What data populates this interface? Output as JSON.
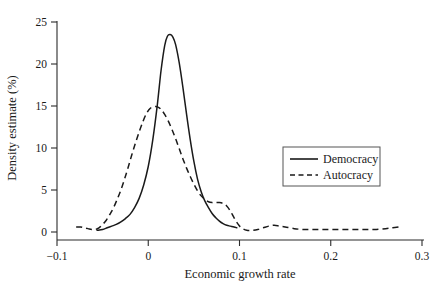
{
  "chart_data": {
    "type": "line",
    "title": "",
    "subtitle": "",
    "xlabel": "Economic growth rate",
    "ylabel": "Density estimate (%)",
    "xlim": [
      -0.1,
      0.3
    ],
    "ylim": [
      0,
      25
    ],
    "xticks": [
      -0.1,
      0,
      0.1,
      0.2,
      0.3
    ],
    "xtick_labels": [
      "−0.1",
      "0",
      "0.1",
      "0.2",
      "0.3"
    ],
    "yticks": [
      0,
      5,
      10,
      15,
      20,
      25
    ],
    "ytick_labels": [
      "0",
      "5",
      "10",
      "15",
      "20",
      "25"
    ],
    "grid": false,
    "legend_position": "center-right",
    "series": [
      {
        "name": "Democracy",
        "style": "solid",
        "color": "#1a1a1a",
        "x": [
          -0.056,
          -0.05,
          -0.045,
          -0.04,
          -0.035,
          -0.03,
          -0.025,
          -0.02,
          -0.015,
          -0.01,
          -0.005,
          0.0,
          0.005,
          0.01,
          0.014,
          0.018,
          0.021,
          0.024,
          0.027,
          0.03,
          0.034,
          0.038,
          0.042,
          0.046,
          0.05,
          0.054,
          0.058,
          0.062,
          0.066,
          0.07,
          0.074,
          0.078,
          0.082,
          0.086,
          0.09,
          0.094,
          0.097
        ],
        "y": [
          0.2,
          0.3,
          0.5,
          0.7,
          0.9,
          1.2,
          1.6,
          2.1,
          2.9,
          4.0,
          5.6,
          7.8,
          11.0,
          15.2,
          19.2,
          22.2,
          23.3,
          23.5,
          23.2,
          22.3,
          20.1,
          17.2,
          14.0,
          11.0,
          8.4,
          6.3,
          4.8,
          3.7,
          2.9,
          2.2,
          1.7,
          1.3,
          1.0,
          0.8,
          0.7,
          0.6,
          0.5
        ]
      },
      {
        "name": "Autocracy",
        "style": "dashed",
        "color": "#1a1a1a",
        "x": [
          -0.079,
          -0.074,
          -0.07,
          -0.066,
          -0.062,
          -0.058,
          -0.054,
          -0.05,
          -0.046,
          -0.042,
          -0.038,
          -0.034,
          -0.03,
          -0.026,
          -0.022,
          -0.018,
          -0.014,
          -0.01,
          -0.006,
          -0.002,
          0.002,
          0.006,
          0.01,
          0.014,
          0.018,
          0.022,
          0.026,
          0.03,
          0.034,
          0.038,
          0.042,
          0.046,
          0.05,
          0.054,
          0.058,
          0.062,
          0.066,
          0.07,
          0.074,
          0.078,
          0.082,
          0.086,
          0.09,
          0.094,
          0.098,
          0.102,
          0.108,
          0.114,
          0.12,
          0.126,
          0.132,
          0.138,
          0.144,
          0.15,
          0.16,
          0.17,
          0.18,
          0.19,
          0.2,
          0.21,
          0.22,
          0.23,
          0.24,
          0.25,
          0.26,
          0.268,
          0.275
        ],
        "y": [
          0.6,
          0.6,
          0.5,
          0.4,
          0.3,
          0.3,
          0.5,
          0.9,
          1.4,
          2.1,
          2.9,
          3.9,
          5.0,
          6.3,
          7.7,
          9.2,
          10.6,
          11.9,
          13.1,
          14.1,
          14.7,
          14.9,
          14.9,
          14.6,
          14.0,
          13.2,
          12.2,
          11.1,
          9.9,
          8.7,
          7.6,
          6.6,
          5.7,
          4.9,
          4.3,
          3.9,
          3.6,
          3.5,
          3.5,
          3.5,
          3.4,
          3.1,
          2.5,
          1.7,
          1.0,
          0.5,
          0.2,
          0.2,
          0.3,
          0.5,
          0.7,
          0.8,
          0.7,
          0.6,
          0.4,
          0.3,
          0.3,
          0.3,
          0.3,
          0.3,
          0.3,
          0.3,
          0.3,
          0.3,
          0.4,
          0.5,
          0.6
        ]
      }
    ],
    "legend": [
      {
        "label": "Democracy",
        "style": "solid"
      },
      {
        "label": "Autocracy",
        "style": "dashed"
      }
    ]
  }
}
